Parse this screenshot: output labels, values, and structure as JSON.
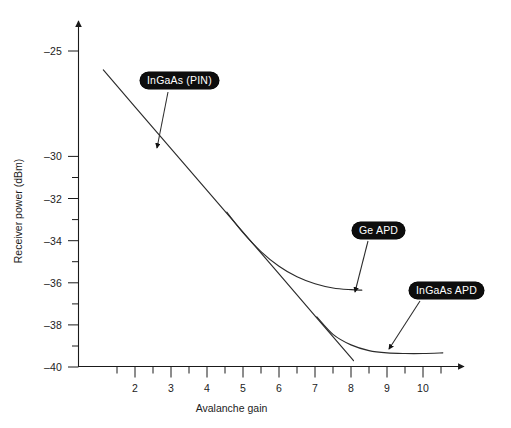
{
  "chart_data": {
    "type": "line",
    "title": "",
    "xlabel": "Avalanche gain",
    "ylabel": "Receiver power (dBm)",
    "xlim": [
      1.0,
      11.0
    ],
    "ylim": [
      -40,
      -24.2
    ],
    "grid": false,
    "legend_position": "inline-callouts",
    "xticks": [
      2,
      3,
      4,
      5,
      6,
      7,
      8,
      9,
      10
    ],
    "xtick_labels": [
      "2",
      "3",
      "4",
      "5",
      "6",
      "7",
      "8",
      "9",
      "10"
    ],
    "x_minor_ticks": [
      1.5,
      2.5,
      3.5,
      4.5,
      5.5,
      6.5,
      7.5,
      8.5,
      9.5,
      10.5
    ],
    "yticks": [
      -25,
      -30,
      -32,
      -34,
      -36,
      -38,
      -40
    ],
    "ytick_labels": [
      "–25",
      "–30",
      "–32",
      "–34",
      "–36",
      "–38",
      "–40"
    ],
    "y_minor_ticks": [
      -31,
      -33,
      -35,
      -37,
      -39
    ],
    "series": [
      {
        "name": "InGaAs (PIN)",
        "style": "straight-line",
        "color": "#2b2b2b",
        "points": [
          [
            1.12,
            -25.9
          ],
          [
            2.0,
            -27.65
          ],
          [
            3.0,
            -29.63
          ],
          [
            4.0,
            -31.62
          ],
          [
            5.0,
            -33.6
          ],
          [
            6.0,
            -35.58
          ],
          [
            7.0,
            -37.57
          ],
          [
            8.0,
            -39.55
          ],
          [
            8.07,
            -39.7
          ]
        ]
      },
      {
        "name": "Ge APD",
        "style": "curve",
        "color": "#2b2b2b",
        "points": [
          [
            4.55,
            -32.65
          ],
          [
            5.0,
            -33.62
          ],
          [
            5.5,
            -34.52
          ],
          [
            6.0,
            -35.22
          ],
          [
            6.5,
            -35.72
          ],
          [
            7.0,
            -36.05
          ],
          [
            7.5,
            -36.25
          ],
          [
            8.0,
            -36.33
          ],
          [
            8.3,
            -36.35
          ]
        ]
      },
      {
        "name": "InGaAs APD",
        "style": "curve",
        "color": "#2b2b2b",
        "points": [
          [
            7.05,
            -37.62
          ],
          [
            7.5,
            -38.45
          ],
          [
            8.0,
            -38.95
          ],
          [
            8.5,
            -39.22
          ],
          [
            9.0,
            -39.33
          ],
          [
            9.5,
            -39.36
          ],
          [
            10.0,
            -39.36
          ],
          [
            10.55,
            -39.33
          ]
        ]
      }
    ],
    "annotations": [
      {
        "label": "InGaAs (PIN)",
        "box_x": 140,
        "box_y": 72,
        "arrow_from": [
          168,
          92
        ],
        "arrow_to": [
          157,
          148
        ]
      },
      {
        "label": "Ge APD",
        "box_x": 352,
        "box_y": 222,
        "arrow_from": [
          368,
          241
        ],
        "arrow_to": [
          355,
          292
        ]
      },
      {
        "label": "InGaAs APD",
        "box_x": 409,
        "box_y": 282,
        "arrow_from": [
          420,
          301
        ],
        "arrow_to": [
          389,
          349
        ]
      }
    ]
  },
  "axes": {
    "x_title": "Avalanche gain",
    "y_title": "Receiver power (dBm)"
  }
}
